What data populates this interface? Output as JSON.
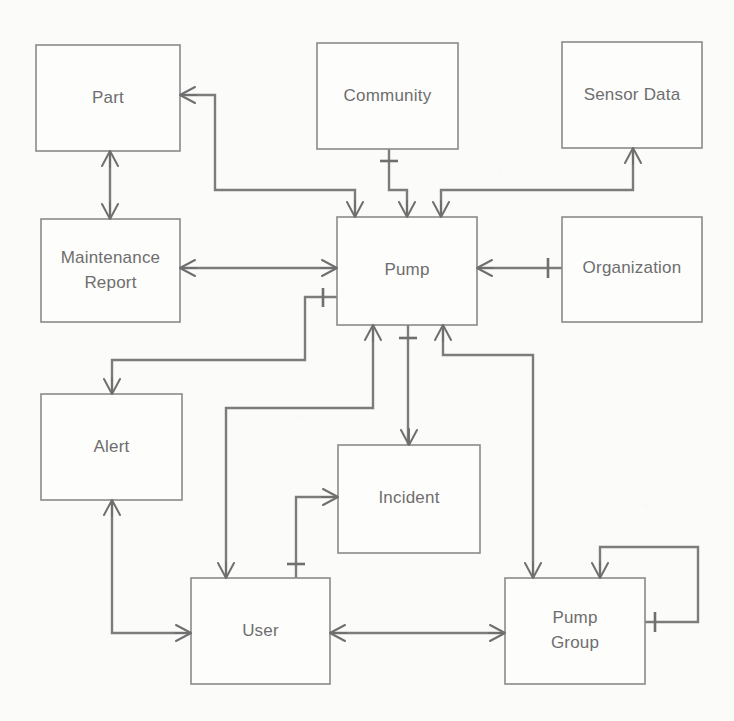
{
  "diagram": {
    "type": "entity-relationship-diagram",
    "background_color": "#fbfbfa",
    "box_fill_color": "#fdfdfc",
    "box_stroke_color": "#8a8a8a",
    "line_color": "#7c7c7c",
    "text_color": "#6e6e6e",
    "entities": [
      {
        "id": "part",
        "label": "Part",
        "lines": [
          "Part"
        ],
        "x": 36,
        "y": 45,
        "w": 144,
        "h": 106
      },
      {
        "id": "community",
        "label": "Community",
        "lines": [
          "Community"
        ],
        "x": 317,
        "y": 43,
        "w": 141,
        "h": 106
      },
      {
        "id": "sensor_data",
        "label": "Sensor Data",
        "lines": [
          "Sensor Data"
        ],
        "x": 562,
        "y": 42,
        "w": 140,
        "h": 106
      },
      {
        "id": "maint",
        "label": "Maintenance Report",
        "lines": [
          "Maintenance",
          "Report"
        ],
        "x": 41,
        "y": 219,
        "w": 139,
        "h": 103
      },
      {
        "id": "pump",
        "label": "Pump",
        "lines": [
          "Pump"
        ],
        "x": 337,
        "y": 217,
        "w": 140,
        "h": 108
      },
      {
        "id": "org",
        "label": "Organization",
        "lines": [
          "Organization"
        ],
        "x": 562,
        "y": 217,
        "w": 140,
        "h": 105
      },
      {
        "id": "alert",
        "label": "Alert",
        "lines": [
          "Alert"
        ],
        "x": 41,
        "y": 394,
        "w": 141,
        "h": 106
      },
      {
        "id": "incident",
        "label": "Incident",
        "lines": [
          "Incident"
        ],
        "x": 338,
        "y": 445,
        "w": 142,
        "h": 108
      },
      {
        "id": "user",
        "label": "User",
        "lines": [
          "User"
        ],
        "x": 191,
        "y": 578,
        "w": 139,
        "h": 106
      },
      {
        "id": "pump_group",
        "label": "Pump Group",
        "lines": [
          "Pump",
          "Group"
        ],
        "x": 505,
        "y": 578,
        "w": 140,
        "h": 106
      }
    ],
    "relationships": [
      {
        "id": "part-pump",
        "from": "part",
        "to": "pump",
        "from_cardinality": "many",
        "to_cardinality": "many"
      },
      {
        "id": "part-maint",
        "from": "part",
        "to": "maint",
        "from_cardinality": "many",
        "to_cardinality": "many"
      },
      {
        "id": "community-pump",
        "from": "community",
        "to": "pump",
        "from_cardinality": "one",
        "to_cardinality": "many"
      },
      {
        "id": "sensor-pump",
        "from": "sensor_data",
        "to": "pump",
        "from_cardinality": "many",
        "to_cardinality": "many"
      },
      {
        "id": "maint-pump",
        "from": "maint",
        "to": "pump",
        "from_cardinality": "many",
        "to_cardinality": "many"
      },
      {
        "id": "pump-org",
        "from": "pump",
        "to": "org",
        "from_cardinality": "many",
        "to_cardinality": "one"
      },
      {
        "id": "pump-alert",
        "from": "pump",
        "to": "alert",
        "from_cardinality": "one",
        "to_cardinality": "many"
      },
      {
        "id": "pump-user",
        "from": "pump",
        "to": "user",
        "from_cardinality": "many",
        "to_cardinality": "many"
      },
      {
        "id": "pump-incident",
        "from": "pump",
        "to": "incident",
        "from_cardinality": "one",
        "to_cardinality": "many"
      },
      {
        "id": "pump-pumpgroup",
        "from": "pump",
        "to": "pump_group",
        "from_cardinality": "many",
        "to_cardinality": "many"
      },
      {
        "id": "alert-user",
        "from": "alert",
        "to": "user",
        "from_cardinality": "many",
        "to_cardinality": "many"
      },
      {
        "id": "incident-user",
        "from": "incident",
        "to": "user",
        "from_cardinality": "many",
        "to_cardinality": "one"
      },
      {
        "id": "user-pumpgroup",
        "from": "user",
        "to": "pump_group",
        "from_cardinality": "many",
        "to_cardinality": "many"
      },
      {
        "id": "pumpgroup-self",
        "from": "pump_group",
        "to": "pump_group",
        "from_cardinality": "one",
        "to_cardinality": "many"
      }
    ]
  },
  "labels": {
    "part": "Part",
    "community": "Community",
    "sensor_data": "Sensor Data",
    "maint_line1": "Maintenance",
    "maint_line2": "Report",
    "pump": "Pump",
    "org": "Organization",
    "alert": "Alert",
    "incident": "Incident",
    "user": "User",
    "pump_group_line1": "Pump",
    "pump_group_line2": "Group"
  }
}
